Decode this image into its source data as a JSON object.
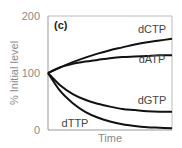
{
  "chart_data": {
    "type": "line",
    "panel_label": "(c)",
    "xlabel": "Time",
    "ylabel": "% Initial level",
    "ylim": [
      0,
      200
    ],
    "yticks": [
      "0",
      "100",
      "200"
    ],
    "grid": false,
    "legend": "inline labels",
    "x": [
      0,
      0.1,
      0.2,
      0.3,
      0.4,
      0.5,
      0.6,
      0.7,
      0.8,
      0.9,
      1.0
    ],
    "series": [
      {
        "name": "dCTP",
        "values": [
          100,
          110,
          119,
          127,
          134,
          140,
          145,
          150,
          154,
          157,
          160
        ]
      },
      {
        "name": "dATP",
        "values": [
          100,
          110,
          116,
          120,
          123,
          126,
          128,
          129,
          130,
          131,
          131
        ]
      },
      {
        "name": "dGTP",
        "values": [
          100,
          78,
          63,
          53,
          46,
          41,
          37,
          35,
          33,
          32,
          32
        ]
      },
      {
        "name": "dTTP",
        "values": [
          100,
          68,
          47,
          32,
          22,
          15,
          10,
          7,
          5,
          4,
          3
        ]
      }
    ]
  }
}
